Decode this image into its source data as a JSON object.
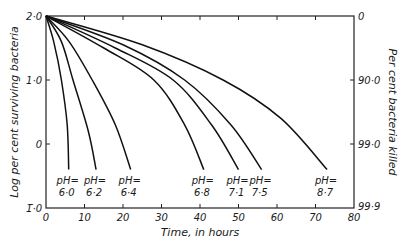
{
  "chart_data": {
    "type": "line",
    "title": "",
    "xlabel": "Time, in hours",
    "ylabel": "Log per cent surviving bacteria",
    "ylabel_right": "Per cent bacteria killed",
    "xlim": [
      0,
      80
    ],
    "ylim": [
      -1.0,
      2.0
    ],
    "x_ticks": [
      0,
      10,
      20,
      30,
      40,
      50,
      60,
      70,
      80
    ],
    "x_tick_labels": [
      "0",
      "10",
      "20",
      "30",
      "40",
      "50",
      "60",
      "70",
      "80"
    ],
    "y_ticks": [
      2.0,
      1.0,
      0,
      -1.0
    ],
    "y_tick_labels": [
      "2·0",
      "1·0",
      "0",
      "1̄·0"
    ],
    "y_right_tick_labels": [
      "0",
      "90·0",
      "99·0",
      "99·9"
    ],
    "grid": false,
    "legend": "inline labels at curve ends",
    "series": [
      {
        "name": "pH=6·0",
        "ph_line1": "pH=",
        "ph_line2": "6·0",
        "points": [
          [
            0,
            2.0
          ],
          [
            2,
            1.6
          ],
          [
            4,
            1.0
          ],
          [
            5.5,
            0.3
          ],
          [
            5.9,
            -0.4
          ]
        ]
      },
      {
        "name": "pH=6·2",
        "ph_line1": "pH=",
        "ph_line2": "6·2",
        "points": [
          [
            0,
            2.0
          ],
          [
            4,
            1.6
          ],
          [
            7,
            1.0
          ],
          [
            11,
            0.2
          ],
          [
            13,
            -0.4
          ]
        ]
      },
      {
        "name": "pH=6·4",
        "ph_line1": "pH=",
        "ph_line2": "6·4",
        "points": [
          [
            0,
            2.0
          ],
          [
            6,
            1.6
          ],
          [
            12,
            1.0
          ],
          [
            18,
            0.3
          ],
          [
            22,
            -0.4
          ]
        ]
      },
      {
        "name": "pH=6·8",
        "ph_line1": "pH=",
        "ph_line2": "6·8",
        "points": [
          [
            0,
            2.0
          ],
          [
            15,
            1.5
          ],
          [
            28,
            1.0
          ],
          [
            36,
            0.3
          ],
          [
            41,
            -0.4
          ]
        ]
      },
      {
        "name": "pH=7·1",
        "ph_line1": "pH=",
        "ph_line2": "7·1",
        "points": [
          [
            0,
            2.0
          ],
          [
            18,
            1.5
          ],
          [
            33,
            1.0
          ],
          [
            43,
            0.3
          ],
          [
            50,
            -0.4
          ]
        ]
      },
      {
        "name": "pH=7·5",
        "ph_line1": "pH=",
        "ph_line2": "7·5",
        "points": [
          [
            0,
            2.0
          ],
          [
            20,
            1.55
          ],
          [
            36,
            1.0
          ],
          [
            48,
            0.3
          ],
          [
            56,
            -0.4
          ]
        ]
      },
      {
        "name": "pH=8·7",
        "ph_line1": "pH=",
        "ph_line2": "8·7",
        "points": [
          [
            0,
            2.0
          ],
          [
            25,
            1.55
          ],
          [
            46,
            1.0
          ],
          [
            61,
            0.4
          ],
          [
            73,
            -0.4
          ]
        ]
      }
    ]
  }
}
